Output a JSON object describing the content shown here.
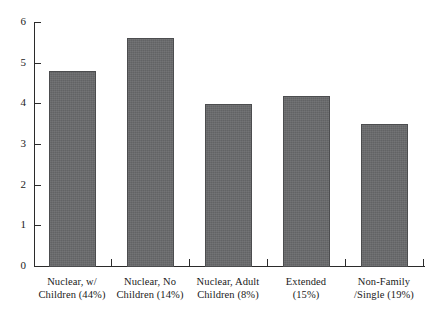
{
  "chart_data": {
    "type": "bar",
    "title": "",
    "subtitle": "",
    "xlabel": "",
    "ylabel": "",
    "ylim": [
      0,
      6
    ],
    "yticks": [
      "0",
      "1",
      "2",
      "3",
      "4",
      "5",
      "6"
    ],
    "grid": false,
    "legend": null,
    "categories": [
      "Nuclear, w/ Children (44%)",
      "Nuclear, No Children (14%)",
      "Nuclear, Adult Children (8%)",
      "Extended (15%)",
      "Non-Family /Single (19%)"
    ],
    "category_lines": [
      {
        "line1": "Nuclear, w/",
        "line2": "Children (44%)"
      },
      {
        "line1": "Nuclear, No",
        "line2": "Children (14%)"
      },
      {
        "line1": "Nuclear, Adult",
        "line2": "Children (8%)"
      },
      {
        "line1": "Extended",
        "line2": "(15%)"
      },
      {
        "line1": "Non-Family",
        "line2": "/Single (19%)"
      }
    ],
    "values": [
      4.8,
      5.6,
      4.0,
      4.2,
      3.5
    ],
    "series": [
      {
        "name": "Household value",
        "values": [
          4.8,
          5.6,
          4.0,
          4.2,
          3.5
        ]
      }
    ],
    "bar_color": "#67686a",
    "bar_edge_color": "#4c4d4f",
    "axis_color": "#2b2b2b",
    "background_color": "#ffffff"
  }
}
